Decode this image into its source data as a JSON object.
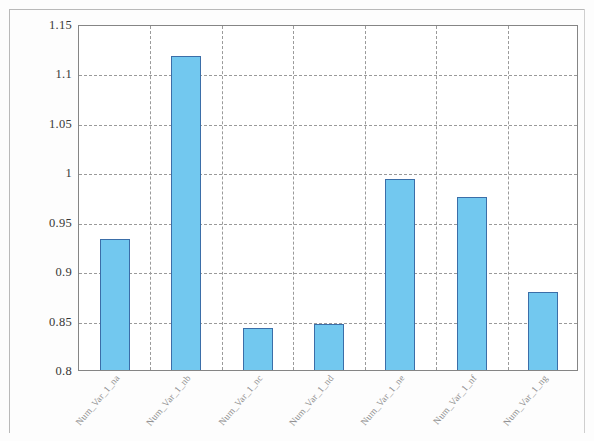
{
  "chart_data": {
    "type": "bar",
    "title": "",
    "subtitle": "",
    "xlabel": "",
    "ylabel": "",
    "categories": [
      "Num_Var_1_na",
      "Num_Var_1_nb",
      "Num_Var_1_nc",
      "Num_Var_1_nd",
      "Num_Var_1_ne",
      "Num_Var_1_nf",
      "Num_Var_1_ng"
    ],
    "values": [
      0.933,
      1.118,
      0.843,
      0.847,
      0.993,
      0.975,
      0.879
    ],
    "ylim": [
      0.8,
      1.15
    ],
    "ytick_labels": [
      "1.15",
      "1.1",
      "1.05",
      "1",
      "0.95",
      "0.9",
      "0.85",
      "0.8"
    ],
    "ytick_values": [
      1.15,
      1.1,
      1.05,
      1.0,
      0.95,
      0.9,
      0.85,
      0.8
    ],
    "grid": true,
    "grid_style": "dashed",
    "legend": false,
    "legend_position": "none",
    "bar_color": "#72C8EF",
    "bar_border_color": "#3B6EA8",
    "grid_color": "#9A9A9A",
    "axis_color": "#858585",
    "background_color": "#FFFFFF"
  }
}
